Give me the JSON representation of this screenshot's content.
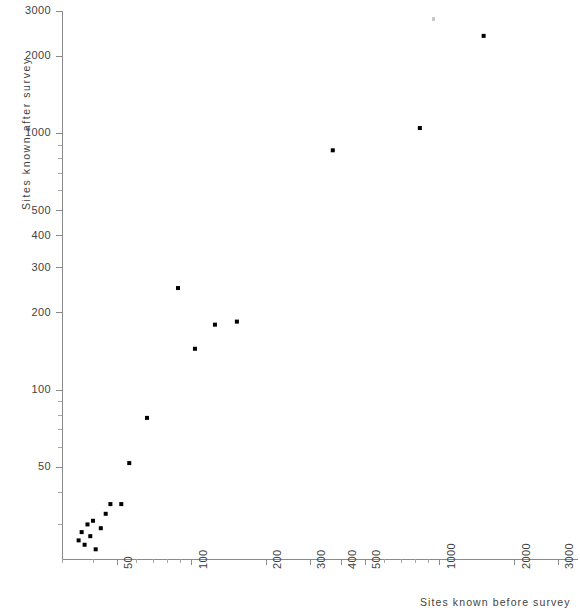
{
  "chart_data": {
    "type": "scatter",
    "title": "",
    "xlabel": "Sites known before survey",
    "ylabel": "Sites known after survey",
    "xscale": "log",
    "yscale": "log",
    "xlim": [
      30,
      3600
    ],
    "ylim": [
      22,
      3000
    ],
    "grid": false,
    "legend": null,
    "x_tick_labels": [
      "50",
      "100",
      "200",
      "300",
      "400",
      "500",
      "1000",
      "2000",
      "3000"
    ],
    "y_tick_labels": [
      "50",
      "100",
      "200",
      "300",
      "400",
      "500",
      "1000",
      "2000",
      "3000"
    ],
    "points": [
      {
        "x": 35,
        "y": 26
      },
      {
        "x": 36,
        "y": 28
      },
      {
        "x": 37,
        "y": 25
      },
      {
        "x": 38,
        "y": 30
      },
      {
        "x": 39,
        "y": 27
      },
      {
        "x": 40,
        "y": 31
      },
      {
        "x": 41,
        "y": 24
      },
      {
        "x": 43,
        "y": 29
      },
      {
        "x": 45,
        "y": 33
      },
      {
        "x": 47,
        "y": 36
      },
      {
        "x": 52,
        "y": 36
      },
      {
        "x": 56,
        "y": 52
      },
      {
        "x": 66,
        "y": 78
      },
      {
        "x": 88,
        "y": 250
      },
      {
        "x": 103,
        "y": 145
      },
      {
        "x": 124,
        "y": 180
      },
      {
        "x": 152,
        "y": 185
      },
      {
        "x": 370,
        "y": 860
      },
      {
        "x": 830,
        "y": 1050
      },
      {
        "x": 1500,
        "y": 2400
      }
    ]
  },
  "axis_titles": {
    "x": "Sites known before survey",
    "y": "Sites known after survey"
  }
}
